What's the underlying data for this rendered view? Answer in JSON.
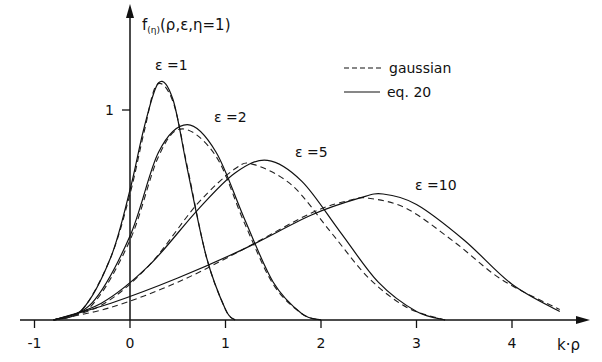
{
  "chart_data": {
    "type": "line",
    "title": "",
    "ylabel": "f(η)(ρ,ε,η=1)",
    "ylabel_main": "f",
    "ylabel_sub": "(η)",
    "ylabel_rest": "(ρ,ε,η=1)",
    "xlabel": "k·ρ",
    "xlim": [
      -1,
      4.6
    ],
    "ylim": [
      0,
      1.3
    ],
    "x_ticks": [
      -1,
      0,
      1,
      2,
      3,
      4
    ],
    "x_tick_labels": [
      "-1",
      "0",
      "1",
      "2",
      "3",
      "4"
    ],
    "y_ticks": [
      1
    ],
    "y_tick_labels": [
      "1"
    ],
    "grid": false,
    "legend": {
      "position": "upper-right",
      "entries": [
        {
          "label": "gaussian",
          "style": "dashed"
        },
        {
          "label": "eq. 20",
          "style": "solid"
        }
      ]
    },
    "series": [
      {
        "name": "ε=1",
        "label": "ε =1",
        "peak_x": 0.32,
        "peak_y": 1.13,
        "style_eq20": "solid",
        "style_gauss": "dashed",
        "eq20": {
          "x": [
            -0.8,
            -0.5,
            -0.2,
            0,
            0.15,
            0.3,
            0.45,
            0.6,
            0.8,
            1.0,
            1.1
          ],
          "y": [
            0.0,
            0.05,
            0.3,
            0.62,
            0.92,
            1.13,
            1.05,
            0.72,
            0.3,
            0.05,
            0.0
          ]
        },
        "gaussian": {
          "x": [
            -0.8,
            -0.5,
            -0.2,
            0,
            0.15,
            0.28,
            0.45,
            0.6,
            0.8,
            1.0,
            1.1
          ],
          "y": [
            0.0,
            0.05,
            0.3,
            0.6,
            0.9,
            1.12,
            1.04,
            0.73,
            0.3,
            0.05,
            0.0
          ]
        }
      },
      {
        "name": "ε=2",
        "label": "ε =2",
        "peak_x": 0.6,
        "peak_y": 0.93,
        "style_eq20": "solid",
        "style_gauss": "dashed",
        "eq20": {
          "x": [
            -0.8,
            -0.4,
            0,
            0.3,
            0.6,
            0.9,
            1.2,
            1.5,
            1.8,
            2.0
          ],
          "y": [
            0.0,
            0.08,
            0.4,
            0.8,
            0.93,
            0.8,
            0.48,
            0.18,
            0.03,
            0.0
          ]
        },
        "gaussian": {
          "x": [
            -0.8,
            -0.4,
            0,
            0.3,
            0.55,
            0.9,
            1.2,
            1.5,
            1.8,
            2.0
          ],
          "y": [
            0.0,
            0.07,
            0.38,
            0.78,
            0.91,
            0.78,
            0.46,
            0.17,
            0.03,
            0.0
          ]
        }
      },
      {
        "name": "ε=5",
        "label": "ε =5",
        "peak_x": 1.44,
        "peak_y": 0.76,
        "style_eq20": "solid",
        "style_gauss": "dashed",
        "eq20": {
          "x": [
            -0.8,
            -0.3,
            0.2,
            0.7,
            1.1,
            1.44,
            1.8,
            2.2,
            2.6,
            3.0,
            3.3
          ],
          "y": [
            0.0,
            0.08,
            0.26,
            0.52,
            0.7,
            0.76,
            0.66,
            0.42,
            0.18,
            0.04,
            0.0
          ]
        },
        "gaussian": {
          "x": [
            -0.8,
            -0.3,
            0.2,
            0.7,
            1.1,
            1.3,
            1.7,
            2.1,
            2.5,
            2.9,
            3.3
          ],
          "y": [
            0.0,
            0.07,
            0.26,
            0.55,
            0.72,
            0.74,
            0.64,
            0.42,
            0.2,
            0.06,
            0.0
          ]
        }
      },
      {
        "name": "ε=10",
        "label": "ε =10",
        "peak_x": 2.65,
        "peak_y": 0.6,
        "style_eq20": "solid",
        "style_gauss": "dashed",
        "eq20": {
          "x": [
            -0.8,
            -0.2,
            0.5,
            1.2,
            1.9,
            2.4,
            2.65,
            3.0,
            3.5,
            4.0,
            4.5
          ],
          "y": [
            0.0,
            0.08,
            0.2,
            0.34,
            0.5,
            0.58,
            0.6,
            0.55,
            0.38,
            0.17,
            0.04
          ]
        },
        "gaussian": {
          "x": [
            -0.8,
            -0.2,
            0.5,
            1.2,
            1.9,
            2.3,
            2.5,
            2.9,
            3.4,
            3.9,
            4.5
          ],
          "y": [
            0.0,
            0.06,
            0.18,
            0.34,
            0.51,
            0.57,
            0.58,
            0.53,
            0.37,
            0.19,
            0.05
          ]
        }
      }
    ]
  }
}
